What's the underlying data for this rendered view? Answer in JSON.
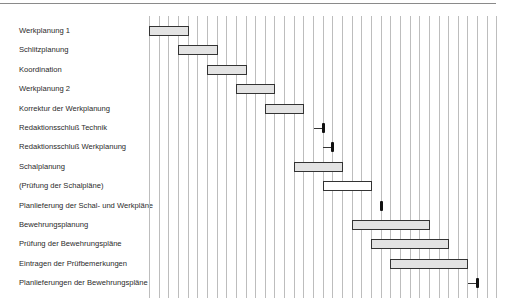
{
  "chart_data": {
    "type": "gantt",
    "title": "",
    "xlabel": "",
    "ylabel": "",
    "grid": true,
    "time_units": 37,
    "tasks": [
      {
        "label": "Werkplanung 1",
        "kind": "bar",
        "start": 0,
        "end": 4,
        "fill": "#e3e3e3"
      },
      {
        "label": "Schlitzplanung",
        "kind": "bar",
        "start": 3,
        "end": 7,
        "fill": "#e3e3e3"
      },
      {
        "label": "Koordination",
        "kind": "bar",
        "start": 6,
        "end": 10,
        "fill": "#e3e3e3"
      },
      {
        "label": "Werkplanung 2",
        "kind": "bar",
        "start": 9,
        "end": 13,
        "fill": "#e3e3e3"
      },
      {
        "label": "Korrektur der Werkplanung",
        "kind": "bar",
        "start": 12,
        "end": 16,
        "fill": "#e3e3e3"
      },
      {
        "label": "Redaktionsschluß Technik",
        "kind": "milestone",
        "at": 18,
        "arrow": true
      },
      {
        "label": "Redaktionsschluß Werkplanung",
        "kind": "milestone",
        "at": 19,
        "arrow": true
      },
      {
        "label": "Schalplanung",
        "kind": "bar",
        "start": 15,
        "end": 20,
        "fill": "#e3e3e3"
      },
      {
        "label": "(Prüfung der Schalpläne)",
        "kind": "bar",
        "start": 18,
        "end": 23,
        "fill": "#ffffff"
      },
      {
        "label": "Planlieferung der Schal- und Werkpläne",
        "kind": "milestone",
        "at": 24,
        "arrow": false
      },
      {
        "label": "Bewehrungsplanung",
        "kind": "bar",
        "start": 21,
        "end": 29,
        "fill": "#e3e3e3"
      },
      {
        "label": "Prüfung der Bewehrungspläne",
        "kind": "bar",
        "start": 23,
        "end": 31,
        "fill": "#e3e3e3"
      },
      {
        "label": "Eintragen der Prüfbemerkungen",
        "kind": "bar",
        "start": 25,
        "end": 33,
        "fill": "#e3e3e3"
      },
      {
        "label": "Planlieferungen der Bewehrungspläne",
        "kind": "milestone",
        "at": 34,
        "arrow": true
      }
    ]
  },
  "colors": {
    "bar_fill": "#e3e3e3",
    "bar_border": "#333333",
    "grid_line": "#bdbdbd",
    "milestone": "#111111"
  }
}
